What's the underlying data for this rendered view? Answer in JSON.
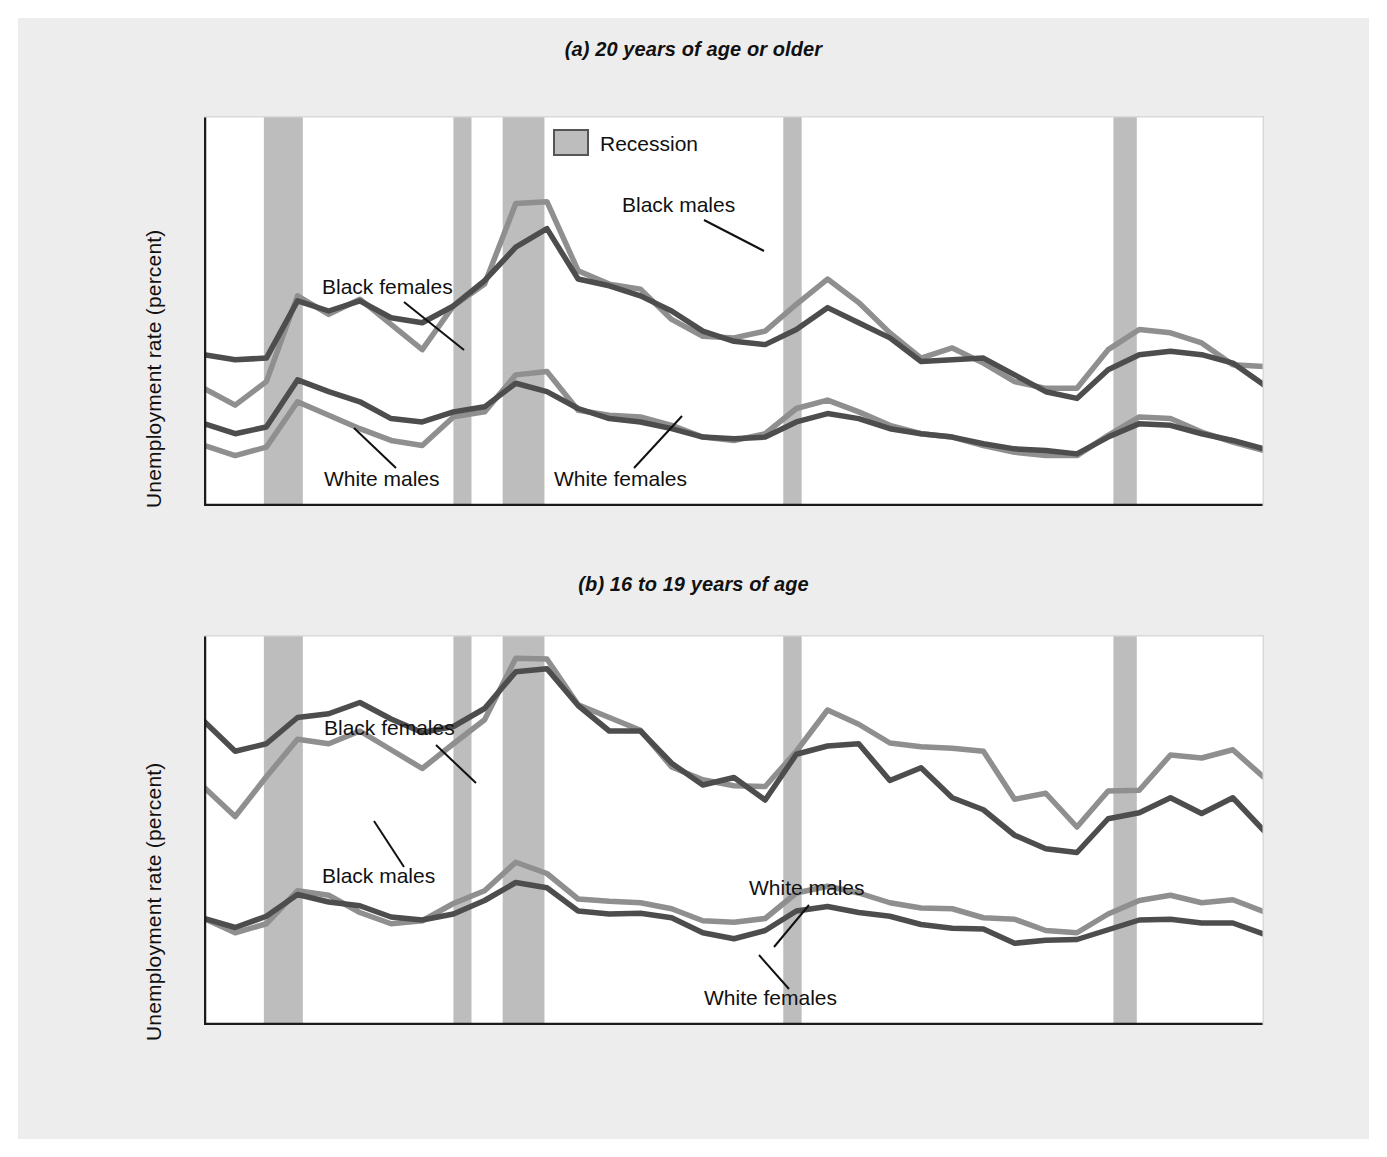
{
  "figure": {
    "background_color": "#ededed",
    "plot_background_color": "#ffffff",
    "recession_band_color": "#bdbdbd",
    "dark_line_color": "#4d4d4d",
    "light_line_color": "#8f8f8f",
    "axis_color": "#1a1a1a"
  },
  "panels": [
    {
      "id": "a",
      "tag": "(a)",
      "title_text": " 20 years of age or older",
      "full_title": "(a) 20 years of age or older",
      "ylabel": "Unemployment rate (percent)",
      "xlabel": "",
      "ytick_labels": [
        "5",
        "10",
        "15",
        "20"
      ],
      "xtick_labels": [
        "1972",
        "1974",
        "1976",
        "1978",
        "1980",
        "1982",
        "1984",
        "1986",
        "1988",
        "1990",
        "1992",
        "1994",
        "1996",
        "1998",
        "2000",
        "2002",
        "2004",
        "2006"
      ],
      "legend": {
        "label": "Recession",
        "swatch_color": "#bdbdbd"
      },
      "series_labels": [
        "Black males",
        "Black females",
        "White males",
        "White females"
      ]
    },
    {
      "id": "b",
      "tag": "(b)",
      "title_text": " 16 to 19 years of age",
      "full_title": "(b) 16 to 19 years of age",
      "ylabel": "Unemployment rate (percent)",
      "xlabel": "",
      "ytick_labels": [
        "10",
        "20",
        "30",
        "40"
      ],
      "xtick_labels": [
        "1972",
        "1974",
        "1976",
        "1978",
        "1980",
        "1982",
        "1984",
        "1986",
        "1988",
        "1990",
        "1992",
        "1994",
        "1996",
        "1998",
        "2000",
        "2002",
        "2004",
        "2006"
      ],
      "series_labels": [
        "Black females",
        "Black males",
        "White males",
        "White females"
      ]
    }
  ],
  "chart_data": [
    {
      "type": "line",
      "panel": "a",
      "title": "(a) 20 years of age or older",
      "xlabel": "",
      "ylabel": "Unemployment rate (percent)",
      "xlim": [
        1972,
        2006
      ],
      "ylim": [
        0,
        23.2
      ],
      "yticks": [
        5,
        10,
        15,
        20
      ],
      "xticks": [
        1972,
        1974,
        1976,
        1978,
        1980,
        1982,
        1984,
        1986,
        1988,
        1990,
        1992,
        1994,
        1996,
        1998,
        2000,
        2002,
        2004,
        2006
      ],
      "grid": false,
      "legend": "Recession",
      "legend_position": "top-center",
      "x": [
        1972,
        1973,
        1974,
        1975,
        1976,
        1977,
        1978,
        1979,
        1980,
        1981,
        1982,
        1983,
        1984,
        1985,
        1986,
        1987,
        1988,
        1989,
        1990,
        1991,
        1992,
        1993,
        1994,
        1995,
        1996,
        1997,
        1998,
        1999,
        2000,
        2001,
        2002,
        2003,
        2004,
        2005,
        2006
      ],
      "series": [
        {
          "name": "Black males",
          "color": "#8f8f8f",
          "values": [
            7.0,
            6.0,
            7.4,
            12.5,
            11.4,
            12.3,
            10.8,
            9.3,
            11.9,
            13.2,
            18.0,
            18.1,
            14.0,
            13.2,
            12.9,
            11.1,
            10.1,
            10.0,
            10.4,
            12.0,
            13.5,
            12.1,
            10.3,
            8.8,
            9.4,
            8.5,
            7.4,
            7.0,
            7.0,
            9.3,
            10.5,
            10.3,
            9.7,
            8.4,
            8.3
          ]
        },
        {
          "name": "Black females",
          "color": "#4d4d4d",
          "values": [
            9.0,
            8.7,
            8.8,
            12.2,
            11.6,
            12.2,
            11.2,
            10.9,
            11.9,
            13.4,
            15.4,
            16.5,
            13.5,
            13.1,
            12.5,
            11.6,
            10.4,
            9.8,
            9.6,
            10.5,
            11.8,
            10.9,
            10.0,
            8.6,
            8.7,
            8.8,
            7.8,
            6.8,
            6.4,
            8.1,
            9.0,
            9.2,
            9.0,
            8.5,
            7.2
          ]
        },
        {
          "name": "White males",
          "color": "#8f8f8f",
          "values": [
            3.6,
            3.0,
            3.5,
            6.2,
            5.4,
            4.6,
            3.9,
            3.6,
            5.3,
            5.6,
            7.8,
            8.0,
            5.7,
            5.4,
            5.3,
            4.8,
            4.1,
            3.9,
            4.3,
            5.8,
            6.3,
            5.6,
            4.8,
            4.3,
            4.1,
            3.6,
            3.2,
            3.0,
            3.0,
            4.2,
            5.3,
            5.2,
            4.4,
            3.8,
            3.3
          ]
        },
        {
          "name": "White females",
          "color": "#4d4d4d",
          "values": [
            4.9,
            4.3,
            4.7,
            7.5,
            6.8,
            6.2,
            5.2,
            5.0,
            5.6,
            5.9,
            7.3,
            6.8,
            5.8,
            5.2,
            5.0,
            4.6,
            4.1,
            4.0,
            4.1,
            5.0,
            5.5,
            5.2,
            4.6,
            4.3,
            4.1,
            3.7,
            3.4,
            3.3,
            3.1,
            4.1,
            4.9,
            4.8,
            4.3,
            3.9,
            3.4
          ]
        }
      ]
    },
    {
      "type": "line",
      "panel": "b",
      "title": "(b) 16 to 19 years of age",
      "xlabel": "",
      "ylabel": "Unemployment rate (percent)",
      "xlim": [
        1972,
        2006
      ],
      "ylim": [
        0,
        52
      ],
      "yticks": [
        10,
        20,
        30,
        40
      ],
      "xticks": [
        1972,
        1974,
        1976,
        1978,
        1980,
        1982,
        1984,
        1986,
        1988,
        1990,
        1992,
        1994,
        1996,
        1998,
        2000,
        2002,
        2004,
        2006
      ],
      "grid": false,
      "x": [
        1972,
        1973,
        1974,
        1975,
        1976,
        1977,
        1978,
        1979,
        1980,
        1981,
        1982,
        1983,
        1984,
        1985,
        1986,
        1987,
        1988,
        1989,
        1990,
        1991,
        1992,
        1993,
        1994,
        1995,
        1996,
        1997,
        1998,
        1999,
        2000,
        2001,
        2002,
        2003,
        2004,
        2005,
        2006
      ],
      "series": [
        {
          "name": "Black females",
          "color": "#4d4d4d",
          "values": [
            40.5,
            36.5,
            37.5,
            41.0,
            41.5,
            43.0,
            40.8,
            39.0,
            39.8,
            42.2,
            47.1,
            47.5,
            42.6,
            39.2,
            39.2,
            34.9,
            32.0,
            33.0,
            30.0,
            36.1,
            37.2,
            37.5,
            32.6,
            34.3,
            30.3,
            28.7,
            25.3,
            23.5,
            23.0,
            27.5,
            28.3,
            30.3,
            28.2,
            30.3,
            25.9
          ]
        },
        {
          "name": "Black males",
          "color": "#8f8f8f",
          "values": [
            31.7,
            27.8,
            33.1,
            38.1,
            37.5,
            39.2,
            36.7,
            34.2,
            37.5,
            40.7,
            48.9,
            48.8,
            42.7,
            41.0,
            39.3,
            34.4,
            32.7,
            31.9,
            31.8,
            36.5,
            42.0,
            40.1,
            37.6,
            37.1,
            36.9,
            36.5,
            30.1,
            30.9,
            26.4,
            31.2,
            31.3,
            36.0,
            35.6,
            36.7,
            33.0
          ]
        },
        {
          "name": "White males",
          "color": "#8f8f8f",
          "values": [
            14.2,
            12.3,
            13.5,
            17.9,
            17.3,
            15.0,
            13.5,
            13.9,
            16.2,
            17.9,
            21.7,
            20.2,
            16.8,
            16.5,
            16.3,
            15.5,
            13.9,
            13.7,
            14.2,
            17.6,
            18.5,
            17.6,
            16.3,
            15.6,
            15.5,
            14.3,
            14.1,
            12.6,
            12.3,
            14.8,
            16.6,
            17.3,
            16.3,
            16.7,
            15.1
          ]
        },
        {
          "name": "White females",
          "color": "#4d4d4d",
          "values": [
            14.2,
            13.0,
            14.5,
            17.4,
            16.4,
            15.9,
            14.4,
            14.0,
            14.8,
            16.6,
            19.0,
            18.3,
            15.2,
            14.8,
            14.9,
            14.3,
            12.3,
            11.5,
            12.6,
            15.2,
            15.8,
            15.0,
            14.5,
            13.4,
            12.9,
            12.8,
            10.9,
            11.3,
            11.4,
            12.7,
            14.0,
            14.1,
            13.6,
            13.6,
            12.1
          ]
        }
      ],
      "recessions": [
        {
          "start": 1973.92,
          "end": 1975.17
        },
        {
          "start": 1980.0,
          "end": 1980.58
        },
        {
          "start": 1981.58,
          "end": 1982.92
        },
        {
          "start": 1990.58,
          "end": 1991.17
        },
        {
          "start": 2001.17,
          "end": 2001.92
        }
      ]
    }
  ],
  "recession_bands": [
    {
      "label": "1973-75 recession",
      "start": 1973.92,
      "end": 1975.17
    },
    {
      "label": "1980 recession",
      "start": 1980.0,
      "end": 1980.58
    },
    {
      "label": "1981-82 recession",
      "start": 1981.58,
      "end": 1982.92
    },
    {
      "label": "1990-91 recession",
      "start": 1990.58,
      "end": 1991.17
    },
    {
      "label": "2001 recession",
      "start": 2001.17,
      "end": 2001.92
    }
  ]
}
